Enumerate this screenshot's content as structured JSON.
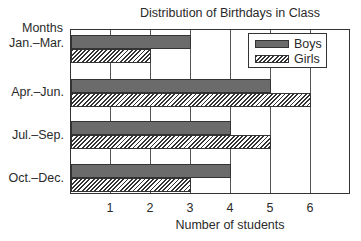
{
  "chart_data": {
    "type": "bar",
    "orientation": "horizontal",
    "title": "Distribution of Birthdays in Class",
    "xlabel": "Number of students",
    "ylabel": "Months",
    "categories": [
      "Jan.–Mar.",
      "Apr.–Jun.",
      "Jul.–Sep.",
      "Oct.–Dec."
    ],
    "series": [
      {
        "name": "Boys",
        "values": [
          3,
          5,
          4,
          4
        ],
        "fill": "solid",
        "color": "#6b6b6b"
      },
      {
        "name": "Girls",
        "values": [
          2,
          6,
          5,
          3
        ],
        "fill": "hatched",
        "color": "#333333"
      }
    ],
    "xlim": [
      0,
      7
    ],
    "xticks": [
      1,
      2,
      3,
      4,
      5,
      6
    ],
    "grid": true,
    "legend_position": "upper right"
  },
  "labels": {
    "title": "Distribution of Birthdays in Class",
    "ylabel": "Months",
    "xlabel": "Number of students",
    "categories": [
      "Jan.–Mar.",
      "Apr.–Jun.",
      "Jul.–Sep.",
      "Oct.–Dec."
    ],
    "ticks": [
      "1",
      "2",
      "3",
      "4",
      "5",
      "6"
    ],
    "legend": {
      "boys": "Boys",
      "girls": "Girls"
    }
  }
}
